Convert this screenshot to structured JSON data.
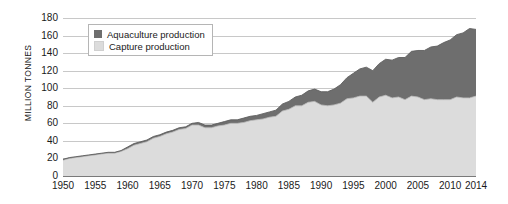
{
  "chart_data": {
    "type": "area",
    "stacked": true,
    "title": "",
    "subtitle": "",
    "xlabel": "",
    "ylabel": "MILLION TONNES",
    "ylim": [
      0,
      180
    ],
    "ytick_step": 20,
    "yticks": [
      0,
      20,
      40,
      60,
      80,
      100,
      120,
      140,
      160,
      180
    ],
    "xlim": [
      1950,
      2014
    ],
    "xticks": [
      1950,
      1955,
      1960,
      1965,
      1970,
      1975,
      1980,
      1985,
      1990,
      1995,
      2000,
      2005,
      2010,
      2014
    ],
    "grid": "horizontal",
    "legend_position": "top-left-inside",
    "colors": {
      "aquaculture": "#6e6e6e",
      "capture": "#dcdcdc",
      "gridline": "#c8c8c8",
      "axis": "#7a7a7a",
      "text": "#1a1a1a",
      "background": "#ffffff"
    },
    "legend": [
      {
        "key": "aquaculture",
        "label": "Aquaculture production",
        "color": "#6e6e6e"
      },
      {
        "key": "capture",
        "label": "Capture production",
        "color": "#dcdcdc"
      }
    ],
    "x": [
      1950,
      1951,
      1952,
      1953,
      1954,
      1955,
      1956,
      1957,
      1958,
      1959,
      1960,
      1961,
      1962,
      1963,
      1964,
      1965,
      1966,
      1967,
      1968,
      1969,
      1970,
      1971,
      1972,
      1973,
      1974,
      1975,
      1976,
      1977,
      1978,
      1979,
      1980,
      1981,
      1982,
      1983,
      1984,
      1985,
      1986,
      1987,
      1988,
      1989,
      1990,
      1991,
      1992,
      1993,
      1994,
      1995,
      1996,
      1997,
      1998,
      1999,
      2000,
      2001,
      2002,
      2003,
      2004,
      2005,
      2006,
      2007,
      2008,
      2009,
      2010,
      2011,
      2012,
      2013,
      2014
    ],
    "series": [
      {
        "name": "Capture production",
        "key": "capture",
        "values": [
          18,
          20,
          21,
          22,
          23,
          24,
          25,
          26,
          26,
          28,
          31,
          35,
          37,
          39,
          43,
          45,
          48,
          50,
          53,
          54,
          58,
          58,
          55,
          55,
          57,
          58,
          60,
          60,
          61,
          63,
          64,
          65,
          67,
          68,
          74,
          76,
          80,
          80,
          84,
          85,
          81,
          80,
          81,
          83,
          88,
          89,
          91,
          91,
          84,
          90,
          92,
          89,
          90,
          87,
          91,
          90,
          87,
          88,
          87,
          87,
          87,
          90,
          89,
          89,
          91
        ]
      },
      {
        "name": "Aquaculture production",
        "key": "aquaculture",
        "values": [
          1,
          1,
          1,
          1,
          1,
          1,
          1,
          1,
          1,
          1,
          2,
          2,
          2,
          2,
          2,
          2,
          2,
          2,
          2,
          2,
          2,
          3,
          3,
          3,
          3,
          4,
          4,
          4,
          5,
          5,
          5,
          6,
          6,
          7,
          8,
          9,
          10,
          12,
          13,
          14,
          15,
          16,
          18,
          21,
          24,
          28,
          31,
          33,
          36,
          38,
          41,
          43,
          45,
          48,
          51,
          53,
          56,
          59,
          61,
          65,
          68,
          71,
          74,
          79,
          76
        ]
      }
    ],
    "totals": [
      19,
      21,
      22,
      23,
      24,
      25,
      26,
      27,
      27,
      29,
      33,
      37,
      39,
      41,
      45,
      47,
      50,
      52,
      55,
      56,
      60,
      61,
      58,
      58,
      60,
      62,
      64,
      64,
      66,
      68,
      69,
      71,
      73,
      75,
      82,
      85,
      90,
      92,
      97,
      99,
      96,
      96,
      99,
      104,
      112,
      117,
      122,
      124,
      120,
      128,
      133,
      132,
      135,
      135,
      142,
      143,
      143,
      147,
      148,
      152,
      155,
      161,
      163,
      168,
      167
    ]
  }
}
